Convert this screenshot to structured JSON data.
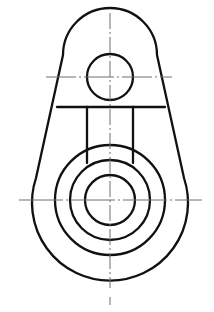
{
  "document": {
    "title": "Mechanical Part Orthographic View",
    "kind": "engineering-drawing",
    "view": "front-view",
    "background_color": "#ffffff",
    "outline_color": "#111111",
    "centerline_color": "#6f6f6f",
    "canvas": {
      "width": 214,
      "height": 312
    }
  },
  "chart_data": {
    "type": "diagram",
    "xlabel": "",
    "ylabel": "",
    "units": "pixels",
    "xlim": [
      0,
      214
    ],
    "ylim": [
      0,
      312
    ],
    "grid": false,
    "legend": "none",
    "geometry": {
      "top_boss": {
        "label": "Upper lug boss",
        "center": [
          110,
          77
        ],
        "outer_radius": 47,
        "hole_radius": 23
      },
      "main_boss": {
        "label": "Lower main boss",
        "center": [
          110,
          200
        ],
        "body_radius": 78,
        "boss_radius": 55,
        "rim_radius": 40,
        "bore_radius": 25
      },
      "shoulder_line": {
        "label": "Shoulder / step line",
        "y": 107,
        "x_start": 57,
        "x_end": 165
      },
      "web_slot": {
        "label": "Vertical web ribs",
        "left_x": 87,
        "right_x": 133,
        "y_top": 107,
        "y_bottom": 163
      },
      "left_profile": {
        "label": "Left tangent flank",
        "from": [
          63,
          55
        ],
        "to": [
          36,
          178
        ]
      },
      "right_profile": {
        "label": "Right tangent flank",
        "from": [
          157,
          55
        ],
        "to": [
          184,
          178
        ]
      }
    },
    "centerlines": {
      "vertical": {
        "x": 110,
        "y_start": 13,
        "y_end": 288
      },
      "vertical_stub": {
        "x": 110,
        "y_start": 297,
        "y_end": 305
      },
      "horizontal_top": {
        "y": 77,
        "x_start": 46,
        "x_end": 172
      },
      "horizontal_main": {
        "y": 200,
        "x_start": 19,
        "x_end": 202
      }
    }
  },
  "labels": {
    "top_hole": "Upper pin hole",
    "main_bore": "Main bore",
    "rim": "Bore rim",
    "boss": "Boss outer",
    "body": "Body outline",
    "shoulder": "Shoulder step",
    "rib_left": "Left rib",
    "rib_right": "Right rib"
  }
}
